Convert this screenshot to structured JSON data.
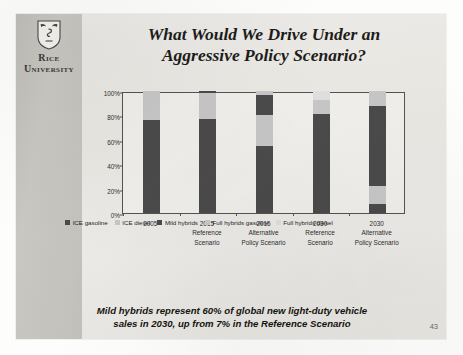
{
  "brand": {
    "logo_line1": "Rice",
    "logo_line2": "University",
    "shield_icon": "rice-shield-icon"
  },
  "title": {
    "line1": "What Would We Drive Under an",
    "line2": "Aggressive Policy Scenario?"
  },
  "caption": {
    "line1": "Mild hybrids represent 60% of global new light-duty vehicle",
    "line2": "sales in 2030, up from 7% in the Reference Scenario"
  },
  "page_number": "43",
  "colors": {
    "dark": "#4a4a4a",
    "light": "#c6c6c6",
    "slide_bg": "#e9e8e4",
    "logo_band": "#c3c1bc",
    "axis": "#55534f"
  },
  "chart_data": {
    "type": "bar",
    "stacked": true,
    "percent_stacked": true,
    "title": "",
    "xlabel": "",
    "ylabel": "",
    "ylim": [
      0,
      100
    ],
    "yticks": [
      "0%",
      "20%",
      "40%",
      "60%",
      "80%",
      "100%"
    ],
    "ytick_values": [
      0,
      20,
      40,
      60,
      80,
      100
    ],
    "grid": false,
    "legend_position": "bottom",
    "categories": [
      {
        "line1": "2005",
        "line2": "",
        "line3": ""
      },
      {
        "line1": "2015",
        "line2": "Reference",
        "line3": "Scenario"
      },
      {
        "line1": "2015",
        "line2": "Alternative",
        "line3": "Policy Scenario"
      },
      {
        "line1": "2030",
        "line2": "Reference",
        "line3": "Scenario"
      },
      {
        "line1": "2030",
        "line2": "Alternative",
        "line3": "Policy Scenario"
      }
    ],
    "series": [
      {
        "name": "ICE gasoline",
        "color": "#4a4a4a",
        "values": [
          76,
          77,
          55,
          0,
          7
        ]
      },
      {
        "name": "ICE diesel",
        "color": "#c6c6c6",
        "values": [
          24,
          21,
          25,
          0,
          15
        ]
      },
      {
        "name": "Mild hybrids",
        "color": "#4a4a4a",
        "values": [
          0,
          2,
          17,
          81,
          66
        ]
      },
      {
        "name": "Full hybrids gasoline",
        "color": "#c6c6c6",
        "values": [
          0,
          0,
          3,
          12,
          12
        ]
      },
      {
        "name": "Full hybrids diesel",
        "color": "#dedede",
        "values": [
          0,
          0,
          0,
          7,
          0
        ]
      }
    ]
  }
}
